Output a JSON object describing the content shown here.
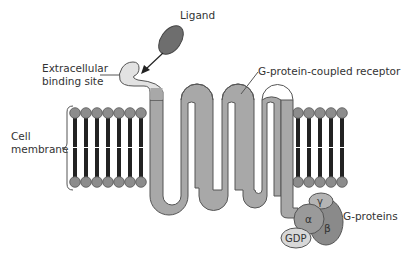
{
  "labels": {
    "ligand": "Ligand",
    "binding_site_line1": "Extracellular",
    "binding_site_line2": "binding site",
    "receptor": "G-protein-coupled receptor",
    "membrane_line1": "Cell",
    "membrane_line2": "membrane",
    "g_proteins": "G-proteins",
    "alpha": "α",
    "beta": "β",
    "gamma": "γ",
    "gdp": "GDP"
  },
  "colors": {
    "receptor_fill": "#a8a8a8",
    "receptor_binding_fill": "#e2e2e2",
    "outline": "#555555",
    "ligand_fill": "#6e6e6e",
    "lipid_head": "#8c8c8c",
    "lipid_tail": "#222222",
    "alpha_fill": "#9a9a9a",
    "beta_fill": "#8a8a8a",
    "gamma_fill": "#b4b4b4",
    "gdp_fill": "#d8d8d8"
  },
  "membrane": {
    "left_lipid_x": [
      75,
      86,
      97,
      108,
      119,
      130,
      141
    ],
    "right_lipid_x": [
      298,
      309,
      320,
      331,
      342
    ],
    "top_head_y": 113,
    "bottom_head_y": 182
  }
}
